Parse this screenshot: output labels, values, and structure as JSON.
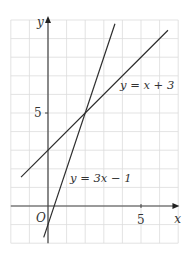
{
  "figure": {
    "axes": {
      "x_label": "x",
      "y_label": "y",
      "origin_label": "O",
      "x_tick_label": "5",
      "y_tick_label": "5",
      "x_tick_value": 5,
      "y_tick_value": 5
    },
    "grid": {
      "x_min": -2,
      "x_max": 7,
      "y_min": -2,
      "y_max": 10,
      "step": 1
    },
    "lines": [
      {
        "name": "line-x-plus-3",
        "label": "y = x + 3",
        "slope": 1,
        "intercept": 3,
        "x_from": -1.45,
        "x_to": 6.45
      },
      {
        "name": "line-3x-minus-1",
        "label": "y = 3x − 1",
        "slope": 3,
        "intercept": -1,
        "x_from": -0.23,
        "x_to": 3.6
      }
    ],
    "intersection": {
      "x": 2,
      "y": 5
    },
    "colors": {
      "grid": "#dcdcdc",
      "axis": "#444444",
      "line": "#2b2b2b",
      "text": "#333333"
    }
  },
  "chart_data": {
    "type": "line",
    "title": "",
    "xlabel": "x",
    "ylabel": "y",
    "xlim": [
      -2,
      7
    ],
    "ylim": [
      -2,
      10
    ],
    "grid": true,
    "series": [
      {
        "name": "y = x + 3",
        "x": [
          -1.45,
          6.45
        ],
        "values": [
          1.55,
          9.45
        ]
      },
      {
        "name": "y = 3x − 1",
        "x": [
          -0.23,
          3.6
        ],
        "values": [
          -1.7,
          9.8
        ]
      }
    ],
    "annotations": [
      "O",
      "5 (x-axis)",
      "5 (y-axis)"
    ],
    "intersection": [
      2,
      5
    ]
  }
}
